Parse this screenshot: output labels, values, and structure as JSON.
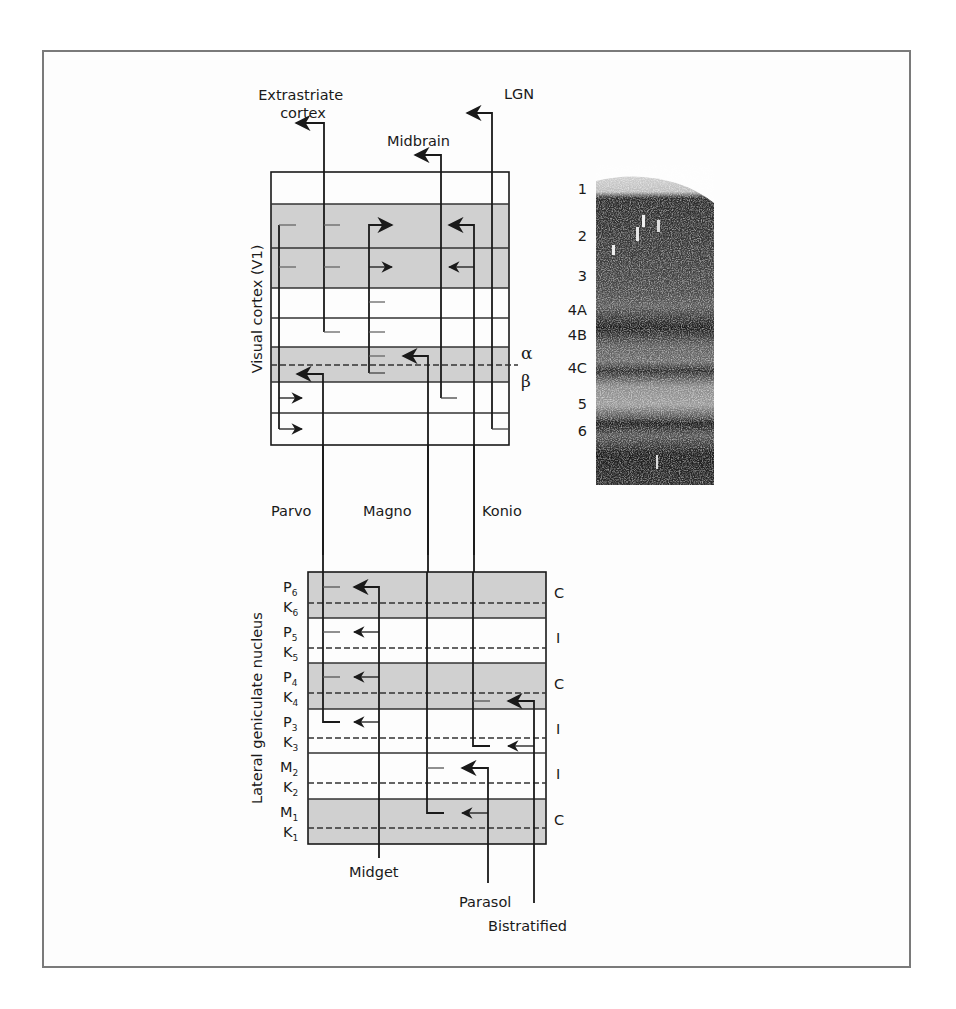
{
  "figure": {
    "targets": {
      "extrastriate": [
        "Extrastriate",
        "cortex"
      ],
      "midbrain": "Midbrain",
      "lgn": "LGN"
    },
    "v1": {
      "axis_label": "Visual cortex (V1)",
      "sublayer_alpha": "α",
      "sublayer_beta": "β"
    },
    "pathways": {
      "parvo": "Parvo",
      "magno": "Magno",
      "konio": "Konio"
    },
    "lgn": {
      "axis_label": "Lateral geniculate nucleus",
      "layers": [
        {
          "main": "P",
          "main_sub": "6",
          "k": "K",
          "k_sub": "6",
          "eye": "C",
          "shaded": true
        },
        {
          "main": "P",
          "main_sub": "5",
          "k": "K",
          "k_sub": "5",
          "eye": "I",
          "shaded": false
        },
        {
          "main": "P",
          "main_sub": "4",
          "k": "K",
          "k_sub": "4",
          "eye": "C",
          "shaded": true
        },
        {
          "main": "P",
          "main_sub": "3",
          "k": "K",
          "k_sub": "3",
          "eye": "I",
          "shaded": false
        },
        {
          "main": "M",
          "main_sub": "2",
          "k": "K",
          "k_sub": "2",
          "eye": "I",
          "shaded": false
        },
        {
          "main": "M",
          "main_sub": "1",
          "k": "K",
          "k_sub": "1",
          "eye": "C",
          "shaded": true
        }
      ]
    },
    "ganglion_cells": {
      "midget": "Midget",
      "parasol": "Parasol",
      "bistratified": "Bistratified"
    },
    "cortical_layers": [
      "1",
      "2",
      "3",
      "4A",
      "4B",
      "4C",
      "5",
      "6"
    ],
    "colors": {
      "shade": "#d0d0d0",
      "line": "#1a1a1a",
      "frame": "#7a7a7a"
    }
  }
}
